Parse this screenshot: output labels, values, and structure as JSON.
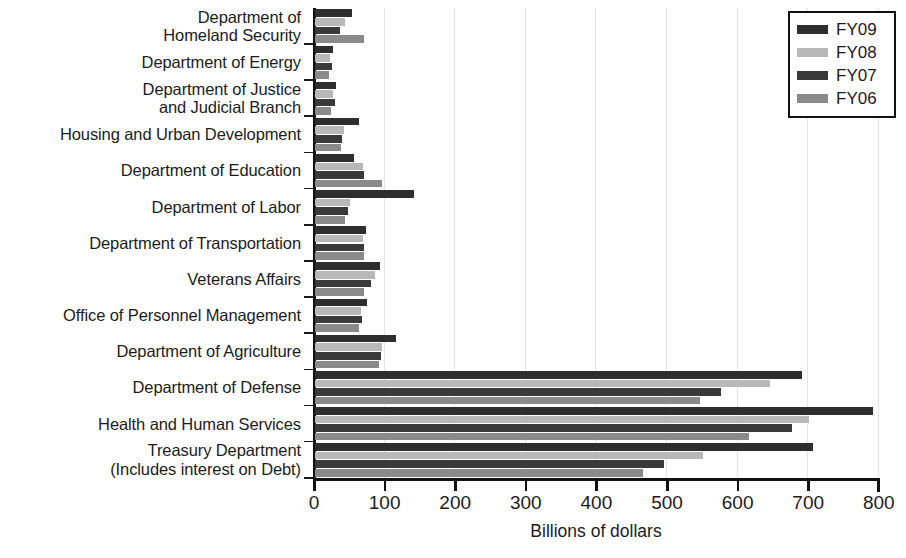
{
  "chart": {
    "type": "bar",
    "orientation": "horizontal",
    "xlabel": "Billions of dollars",
    "ylabel": "",
    "title": "",
    "xlim": [
      0,
      800
    ],
    "xticks": [
      0,
      100,
      200,
      300,
      400,
      500,
      600,
      700,
      800
    ],
    "xtick_labels": [
      "0",
      "100",
      "200",
      "300",
      "400",
      "500",
      "600",
      "700",
      "800"
    ],
    "grid": true,
    "legend_position": "top-right"
  },
  "chart_data": {
    "type": "bar",
    "orientation": "horizontal",
    "title": "",
    "xlabel": "Billions of dollars",
    "ylabel": "",
    "xlim": [
      0,
      800
    ],
    "xticks": [
      0,
      100,
      200,
      300,
      400,
      500,
      600,
      700,
      800
    ],
    "grid": true,
    "legend_position": "top-right",
    "categories": [
      "Department of\nHomeland Security",
      "Department of Energy",
      "Department of Justice\nand Judicial Branch",
      "Housing and Urban Development",
      "Department of Education",
      "Department of Labor",
      "Department of Transportation",
      "Veterans Affairs",
      "Office of Personnel Management",
      "Department of Agriculture",
      "Department of Defense",
      "Health and Human Services",
      "Treasury Department\n(Includes interest on Debt)"
    ],
    "series": [
      {
        "name": "FY09",
        "color": "#2e2e2e",
        "values": [
          52,
          25,
          30,
          62,
          55,
          140,
          72,
          92,
          73,
          115,
          690,
          790,
          705
        ]
      },
      {
        "name": "FY08",
        "color": "#b8b8b8",
        "values": [
          42,
          21,
          25,
          41,
          68,
          50,
          68,
          85,
          65,
          95,
          645,
          700,
          550
        ]
      },
      {
        "name": "FY07",
        "color": "#3a3a3a",
        "values": [
          35,
          24,
          28,
          38,
          70,
          47,
          70,
          80,
          67,
          93,
          575,
          675,
          495
        ]
      },
      {
        "name": "FY06",
        "color": "#8a8a8a",
        "values": [
          70,
          20,
          22,
          37,
          95,
          43,
          70,
          70,
          62,
          90,
          545,
          615,
          465
        ]
      }
    ]
  },
  "legend": {
    "items": [
      {
        "label": "FY09",
        "color": "#2e2e2e"
      },
      {
        "label": "FY08",
        "color": "#b8b8b8"
      },
      {
        "label": "FY07",
        "color": "#3a3a3a"
      },
      {
        "label": "FY06",
        "color": "#8a8a8a"
      }
    ]
  }
}
